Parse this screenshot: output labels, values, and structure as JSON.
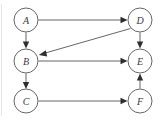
{
  "diagram": {
    "node_radius": 12,
    "node_stroke_color": "#555555",
    "node_fill_color": "#ffffff",
    "edge_color": "#4a4a4a",
    "label_color": "#3a3a3a",
    "background_color": "#ffffff",
    "nodes": [
      {
        "id": "A",
        "label": "A",
        "cx": 26,
        "cy": 20
      },
      {
        "id": "B",
        "label": "B",
        "cx": 26,
        "cy": 61
      },
      {
        "id": "C",
        "label": "C",
        "cx": 26,
        "cy": 101
      },
      {
        "id": "D",
        "label": "D",
        "cx": 140,
        "cy": 20
      },
      {
        "id": "E",
        "label": "E",
        "cx": 140,
        "cy": 61
      },
      {
        "id": "F",
        "label": "F",
        "cx": 140,
        "cy": 101
      }
    ],
    "edges": [
      {
        "id": "A-D",
        "from": "A",
        "to": "D",
        "kind": "horizontal",
        "directed": true
      },
      {
        "id": "A-B",
        "from": "A",
        "to": "B",
        "kind": "vertical",
        "directed": true
      },
      {
        "id": "D-B",
        "from": "D",
        "to": "B",
        "kind": "diagonal",
        "directed": true
      },
      {
        "id": "D-E",
        "from": "D",
        "to": "E",
        "kind": "vertical",
        "directed": true
      },
      {
        "id": "B-E",
        "from": "B",
        "to": "E",
        "kind": "horizontal",
        "directed": true
      },
      {
        "id": "B-C",
        "from": "B",
        "to": "C",
        "kind": "vertical",
        "directed": true
      },
      {
        "id": "C-F",
        "from": "C",
        "to": "F",
        "kind": "horizontal",
        "directed": true
      },
      {
        "id": "F-E",
        "from": "F",
        "to": "E",
        "kind": "vertical",
        "directed": true
      }
    ]
  }
}
